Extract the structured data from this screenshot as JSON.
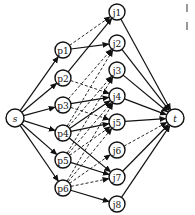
{
  "diagram": {
    "type": "flow-network",
    "nodes": [
      {
        "id": "s",
        "label": "s",
        "x": 15,
        "y": 118,
        "r": 9,
        "italic": true
      },
      {
        "id": "p1",
        "label": "p1",
        "x": 63,
        "y": 50,
        "r": 8
      },
      {
        "id": "p2",
        "label": "p2",
        "x": 63,
        "y": 78,
        "r": 8
      },
      {
        "id": "p3",
        "label": "p3",
        "x": 63,
        "y": 105,
        "r": 8
      },
      {
        "id": "p4",
        "label": "p4",
        "x": 63,
        "y": 133,
        "r": 8
      },
      {
        "id": "p5",
        "label": "p5",
        "x": 63,
        "y": 160,
        "r": 8
      },
      {
        "id": "p6",
        "label": "p6",
        "x": 63,
        "y": 188,
        "r": 8
      },
      {
        "id": "j1",
        "label": "j1",
        "x": 117,
        "y": 12,
        "r": 8
      },
      {
        "id": "j2",
        "label": "j2",
        "x": 117,
        "y": 43,
        "r": 8
      },
      {
        "id": "j3",
        "label": "j3",
        "x": 117,
        "y": 70,
        "r": 8
      },
      {
        "id": "j4",
        "label": "j4",
        "x": 117,
        "y": 96,
        "r": 8
      },
      {
        "id": "j5",
        "label": "j5",
        "x": 117,
        "y": 122,
        "r": 8
      },
      {
        "id": "j6",
        "label": "j6",
        "x": 117,
        "y": 150,
        "r": 8
      },
      {
        "id": "j7",
        "label": "j7",
        "x": 117,
        "y": 177,
        "r": 8
      },
      {
        "id": "j8",
        "label": "j8",
        "x": 117,
        "y": 204,
        "r": 8
      },
      {
        "id": "t",
        "label": "t",
        "x": 175,
        "y": 118,
        "r": 9,
        "italic": true
      }
    ],
    "edges": [
      {
        "from": "s",
        "to": "p1",
        "style": "solid"
      },
      {
        "from": "s",
        "to": "p2",
        "style": "solid"
      },
      {
        "from": "s",
        "to": "p3",
        "style": "solid"
      },
      {
        "from": "s",
        "to": "p4",
        "style": "solid"
      },
      {
        "from": "s",
        "to": "p5",
        "style": "solid"
      },
      {
        "from": "s",
        "to": "p6",
        "style": "solid"
      },
      {
        "from": "p1",
        "to": "j1",
        "style": "dashed"
      },
      {
        "from": "p1",
        "to": "j2",
        "style": "solid"
      },
      {
        "from": "p2",
        "to": "j1",
        "style": "solid"
      },
      {
        "from": "p2",
        "to": "j4",
        "style": "dashed"
      },
      {
        "from": "p3",
        "to": "j2",
        "style": "dashed"
      },
      {
        "from": "p3",
        "to": "j4",
        "style": "solid"
      },
      {
        "from": "p3",
        "to": "j5",
        "style": "dashed"
      },
      {
        "from": "p4",
        "to": "j2",
        "style": "dashed"
      },
      {
        "from": "p4",
        "to": "j3",
        "style": "dashed"
      },
      {
        "from": "p4",
        "to": "j4",
        "style": "solid"
      },
      {
        "from": "p4",
        "to": "j5",
        "style": "solid"
      },
      {
        "from": "p4",
        "to": "j7",
        "style": "solid"
      },
      {
        "from": "p5",
        "to": "j3",
        "style": "dashed"
      },
      {
        "from": "p5",
        "to": "j4",
        "style": "dashed"
      },
      {
        "from": "p5",
        "to": "j5",
        "style": "dashed"
      },
      {
        "from": "p5",
        "to": "j7",
        "style": "solid"
      },
      {
        "from": "p6",
        "to": "j4",
        "style": "dashed"
      },
      {
        "from": "p6",
        "to": "j5",
        "style": "dashed"
      },
      {
        "from": "p6",
        "to": "j6",
        "style": "dashed"
      },
      {
        "from": "p6",
        "to": "j7",
        "style": "dashed"
      },
      {
        "from": "p6",
        "to": "j8",
        "style": "solid"
      },
      {
        "from": "j1",
        "to": "t",
        "style": "solid"
      },
      {
        "from": "j2",
        "to": "t",
        "style": "solid"
      },
      {
        "from": "j3",
        "to": "t",
        "style": "solid"
      },
      {
        "from": "j4",
        "to": "t",
        "style": "solid"
      },
      {
        "from": "j5",
        "to": "t",
        "style": "solid"
      },
      {
        "from": "j6",
        "to": "t",
        "style": "dashed"
      },
      {
        "from": "j7",
        "to": "t",
        "style": "solid"
      },
      {
        "from": "j8",
        "to": "t",
        "style": "solid"
      }
    ]
  },
  "colors": {
    "stroke": "#111111",
    "background": "#ffffff"
  }
}
